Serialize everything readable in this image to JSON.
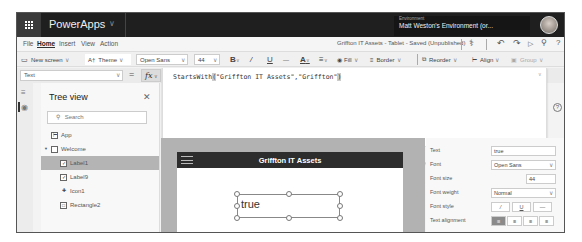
{
  "topbar": {
    "app_name": "PowerApps",
    "environment_label": "Environment",
    "environment_name": "Matt Weston's Environment (or..."
  },
  "menu": {
    "items": [
      "File",
      "Home",
      "Insert",
      "View",
      "Action"
    ],
    "active": "Home",
    "document_title": "Griffton IT Assets - Tablet - Saved (Unpublished)",
    "icons": [
      "app-checker-icon",
      "undo-icon",
      "redo-icon",
      "play-icon",
      "user-share-icon",
      "help-icon"
    ]
  },
  "ribbon": {
    "new_screen": "New screen",
    "theme": "Theme",
    "font": "Open Sans",
    "font_size": "44",
    "bold": "B",
    "italic": "/",
    "underline": "U",
    "strikethrough": "—",
    "font_color": "A",
    "align": "≡",
    "fill": "Fill",
    "border": "Border",
    "reorder": "Reorder",
    "align_menu": "Align",
    "group": "Group"
  },
  "formula_bar": {
    "property": "Text",
    "equals": "=",
    "fx": "fx",
    "formula_prefix": "StartsWith",
    "formula_open": "(",
    "formula_args": "\"Griffton IT Assets\",\"Griffton\"",
    "formula_close": ")",
    "format_text": "Format text",
    "remove_formatting": "Remove formatting"
  },
  "tree_view": {
    "title": "Tree view",
    "search_placeholder": "Search",
    "items": [
      {
        "label": "App",
        "icon": "app-icon",
        "level": 0
      },
      {
        "label": "Welcome",
        "icon": "screen-icon",
        "level": 0,
        "expanded": true
      },
      {
        "label": "Label1",
        "icon": "label-icon",
        "level": 1,
        "selected": true
      },
      {
        "label": "Label9",
        "icon": "label-icon",
        "level": 1
      },
      {
        "label": "Icon1",
        "icon": "icon-control-icon",
        "level": 1
      },
      {
        "label": "Rectangle2",
        "icon": "rectangle-icon",
        "level": 1
      }
    ]
  },
  "canvas": {
    "screen_title": "Griffton IT Assets",
    "label_value": "true"
  },
  "properties": {
    "rows": [
      {
        "label": "Text",
        "value": "true"
      },
      {
        "label": "Font",
        "value": "Open Sans"
      },
      {
        "label": "Font size",
        "value": "44"
      },
      {
        "label": "Font weight",
        "value": "Normal"
      },
      {
        "label": "Font style",
        "buttons": [
          "/",
          "U",
          "—"
        ]
      },
      {
        "label": "Text alignment",
        "buttons": [
          "≡",
          "≡",
          "≡",
          "≡"
        ]
      }
    ]
  },
  "colors": {
    "topbar": "#1f1f1f",
    "screen_header": "#2d2d2d",
    "canvas_bg": "#b2b2b2",
    "selected_row": "#b4b4b4"
  }
}
